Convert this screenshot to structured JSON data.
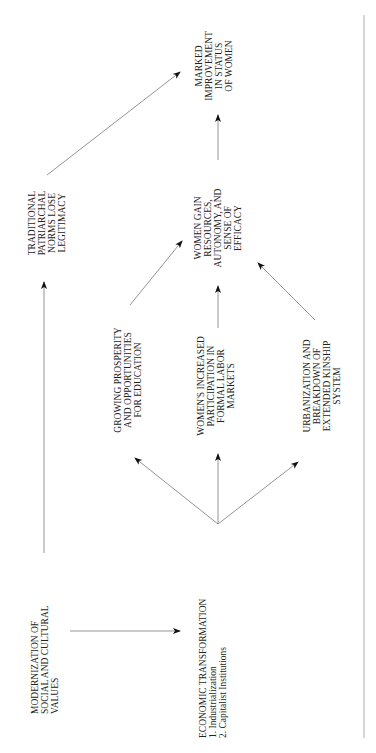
{
  "diagram": {
    "nodes": {
      "modernization": {
        "lines": [
          "MODERNIZATION OF",
          "SOCIAL AND CULTURAL",
          "VALUES"
        ]
      },
      "economic": {
        "title": "ECONOMIC TRANSFORMATION",
        "items": [
          "1.   Industrialization",
          "2.   Capitalist Institutions"
        ]
      },
      "prosperity": {
        "lines": [
          "GROWING PROSPERITY",
          "AND OPPORTUNITIES",
          "FOR EDUCATION"
        ]
      },
      "labor": {
        "lines": [
          "WOMEN'S INCREASED",
          "PARTICIPATION IN",
          "FORMAL LABOR",
          "MARKETS"
        ]
      },
      "urbanization": {
        "lines": [
          "URBANIZATION AND",
          "BREAKDOWN OF",
          "EXTENDED KINSHIP",
          "SYSTEM"
        ]
      },
      "traditional": {
        "lines": [
          "TRADITIONAL",
          "PATRIARCHAL",
          "NORMS LOSE",
          "LEGITIMACY"
        ]
      },
      "women_gain": {
        "lines": [
          "WOMEN GAIN",
          "RESOURCES,",
          "AUTONOMY, AND",
          "SENSE OF",
          "EFFICACY"
        ]
      },
      "marked": {
        "lines": [
          "MARKED",
          "IMPROVEMENT",
          "IN STATUS",
          "OF WOMEN"
        ]
      }
    },
    "edges": [
      [
        "modernization",
        "economic"
      ],
      [
        "modernization",
        "traditional"
      ],
      [
        "economic",
        "prosperity"
      ],
      [
        "economic",
        "labor"
      ],
      [
        "economic",
        "urbanization"
      ],
      [
        "prosperity",
        "women_gain"
      ],
      [
        "labor",
        "women_gain"
      ],
      [
        "urbanization",
        "women_gain"
      ],
      [
        "traditional",
        "marked"
      ],
      [
        "women_gain",
        "marked"
      ]
    ],
    "colors": {
      "line": "#888888",
      "arrowhead": "#111111",
      "text": "#222222"
    }
  }
}
